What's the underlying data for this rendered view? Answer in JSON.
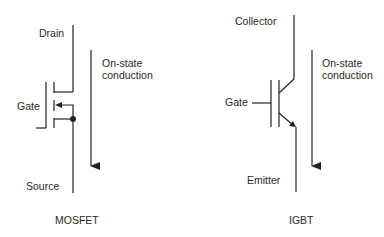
{
  "diagrams": [
    {
      "id": "mosfet",
      "caption": "MOSFET",
      "terminals": {
        "top": "Drain",
        "gate": "Gate",
        "bottom": "Source"
      },
      "conduction_label": [
        "On-state",
        "conduction"
      ]
    },
    {
      "id": "igbt",
      "caption": "IGBT",
      "terminals": {
        "top": "Collector",
        "gate": "Gate",
        "bottom": "Emitter"
      },
      "conduction_label": [
        "On-state",
        "conduction"
      ]
    }
  ],
  "colors": {
    "line": "#222222",
    "background": "#ffffff"
  }
}
